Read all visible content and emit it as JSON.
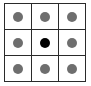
{
  "grid": {
    "rows": 3,
    "cols": 3,
    "line_color": "#2a2a2a",
    "cells": [
      {
        "row": 0,
        "col": 0,
        "dot_color": "#6e6e6e",
        "state": "gray"
      },
      {
        "row": 0,
        "col": 1,
        "dot_color": "#6e6e6e",
        "state": "gray"
      },
      {
        "row": 0,
        "col": 2,
        "dot_color": "#6e6e6e",
        "state": "gray"
      },
      {
        "row": 1,
        "col": 0,
        "dot_color": "#6e6e6e",
        "state": "gray"
      },
      {
        "row": 1,
        "col": 1,
        "dot_color": "#000000",
        "state": "black"
      },
      {
        "row": 1,
        "col": 2,
        "dot_color": "#6e6e6e",
        "state": "gray"
      },
      {
        "row": 2,
        "col": 0,
        "dot_color": "#6e6e6e",
        "state": "gray"
      },
      {
        "row": 2,
        "col": 1,
        "dot_color": "#6e6e6e",
        "state": "gray"
      },
      {
        "row": 2,
        "col": 2,
        "dot_color": "#6e6e6e",
        "state": "gray"
      }
    ]
  }
}
